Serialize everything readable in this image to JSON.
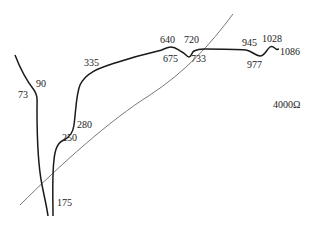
{
  "diagram": {
    "resistance_label": "4000Ω",
    "colors": {
      "curve": "#1a1a1a",
      "diagonal": "#555555",
      "text": "#222222",
      "background": "#ffffff"
    },
    "point_labels": [
      {
        "id": "p73",
        "text": "73",
        "x": 18,
        "y": 98
      },
      {
        "id": "p90",
        "text": "90",
        "x": 36,
        "y": 87
      },
      {
        "id": "p335",
        "text": "335",
        "x": 84,
        "y": 66
      },
      {
        "id": "p280",
        "text": "280",
        "x": 77,
        "y": 128
      },
      {
        "id": "p250",
        "text": "250",
        "x": 62,
        "y": 141
      },
      {
        "id": "p175",
        "text": "175",
        "x": 57,
        "y": 206
      },
      {
        "id": "p640",
        "text": "640",
        "x": 160,
        "y": 43
      },
      {
        "id": "p675",
        "text": "675",
        "x": 163,
        "y": 62
      },
      {
        "id": "p720",
        "text": "720",
        "x": 184,
        "y": 43
      },
      {
        "id": "p733",
        "text": "733",
        "x": 191,
        "y": 62
      },
      {
        "id": "p945",
        "text": "945",
        "x": 242,
        "y": 46
      },
      {
        "id": "p977",
        "text": "977",
        "x": 247,
        "y": 68
      },
      {
        "id": "p1028",
        "text": "1028",
        "x": 262,
        "y": 42
      },
      {
        "id": "p1086",
        "text": "1086",
        "x": 280,
        "y": 55
      }
    ]
  }
}
